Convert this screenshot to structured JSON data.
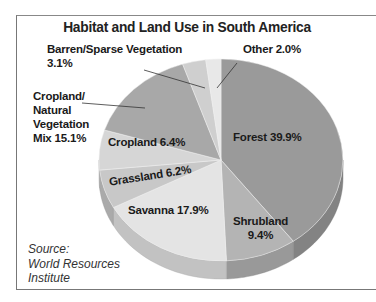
{
  "chart_data": {
    "type": "pie",
    "title": "Habitat and Land Use in South America",
    "categories": [
      "Forest",
      "Shrubland",
      "Savanna",
      "Grassland",
      "Cropland",
      "Cropland/Natural Vegetation Mix",
      "Barren/Sparse Vegetation",
      "Other"
    ],
    "values": [
      39.9,
      9.4,
      17.9,
      6.2,
      6.4,
      15.1,
      3.1,
      2.0
    ],
    "unit": "%",
    "style": "3d",
    "source": "World Resources Institute"
  },
  "title": "Habitat and Land Use in South America",
  "labels": {
    "forest": "Forest 39.9%",
    "shrubland_1": "Shrubland",
    "shrubland_2": "9.4%",
    "savanna": "Savanna 17.9%",
    "grassland": "Grassland 6.2%",
    "cropland": "Cropland 6.4%",
    "mix_1": "Cropland/",
    "mix_2": "Natural",
    "mix_3": "Vegetation",
    "mix_4": "Mix 15.1%",
    "barren_1": "Barren/Sparse Vegetation",
    "barren_2": "3.1%",
    "other": "Other 2.0%"
  },
  "source": {
    "line1": "Source:",
    "line2": "World Resources",
    "line3": "Institute"
  },
  "colors": {
    "forest": "#9a9a9a",
    "shrubland": "#b4b4b4",
    "savanna": "#e4e4e4",
    "grassland": "#c8c8c8",
    "cropland": "#d6d6d6",
    "mix": "#a8a8a8",
    "barren": "#cfcfcf",
    "other": "#e8e8e8"
  }
}
